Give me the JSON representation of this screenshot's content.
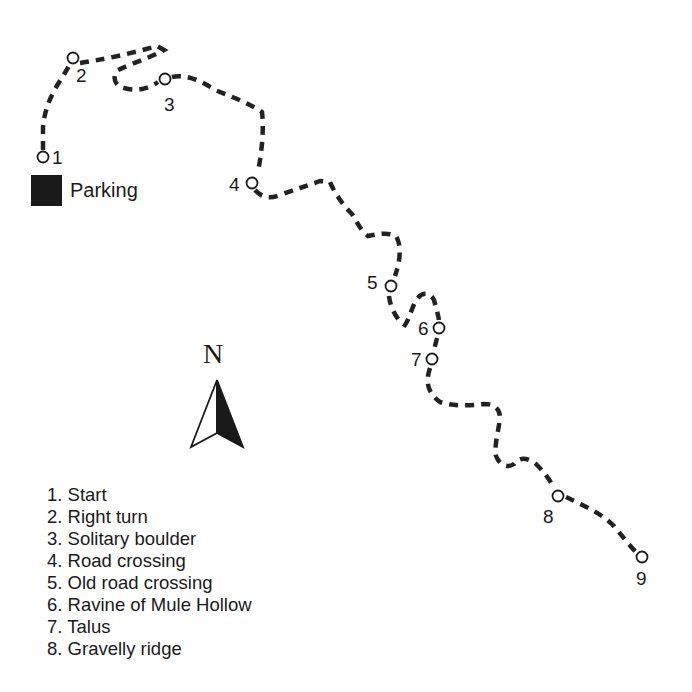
{
  "map": {
    "parking_label": "Parking",
    "north_label": "N",
    "trail_color": "#222222",
    "waypoints": [
      {
        "id": "1",
        "label": "1",
        "x": 43,
        "y": 157
      },
      {
        "id": "2",
        "label": "2",
        "x": 73,
        "y": 58
      },
      {
        "id": "3",
        "label": "3",
        "x": 165,
        "y": 79
      },
      {
        "id": "4",
        "label": "4",
        "x": 252,
        "y": 183
      },
      {
        "id": "5",
        "label": "5",
        "x": 391,
        "y": 286
      },
      {
        "id": "6",
        "label": "6",
        "x": 439,
        "y": 328
      },
      {
        "id": "7",
        "label": "7",
        "x": 432,
        "y": 358
      },
      {
        "id": "8",
        "label": "8",
        "x": 558,
        "y": 496
      },
      {
        "id": "9",
        "label": "9",
        "x": 642,
        "y": 557
      }
    ]
  },
  "legend": {
    "items": [
      {
        "num": "1.",
        "text": "Start"
      },
      {
        "num": "2.",
        "text": "Right turn"
      },
      {
        "num": "3.",
        "text": "Solitary boulder"
      },
      {
        "num": "4.",
        "text": "Road crossing"
      },
      {
        "num": "5.",
        "text": "Old road crossing"
      },
      {
        "num": "6.",
        "text": "Ravine of Mule Hollow"
      },
      {
        "num": "7.",
        "text": "Talus"
      },
      {
        "num": "8.",
        "text": "Gravelly ridge"
      }
    ]
  }
}
